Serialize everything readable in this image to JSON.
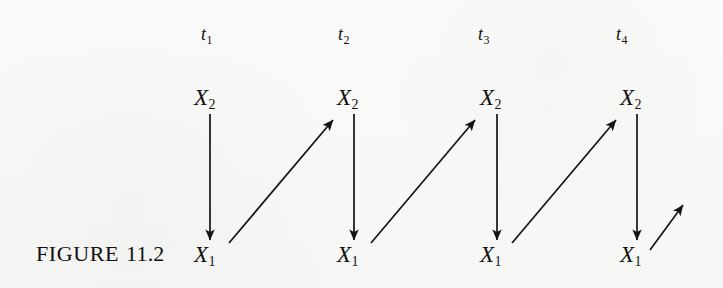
{
  "figure": {
    "caption_word": "FIGURE",
    "caption_number": "11.2",
    "background_color": "#fbfbfa",
    "ink_color": "#121212"
  },
  "time_axis": {
    "labels": [
      {
        "base": "t",
        "sub": "1",
        "x": 201,
        "y": 25
      },
      {
        "base": "t",
        "sub": "2",
        "x": 338,
        "y": 25
      },
      {
        "base": "t",
        "sub": "3",
        "x": 478,
        "y": 25
      },
      {
        "base": "t",
        "sub": "4",
        "x": 616,
        "y": 25
      }
    ]
  },
  "panels": [
    {
      "time": "t1",
      "top_label": {
        "base": "X",
        "sub": "2",
        "x": 194,
        "y": 86
      },
      "bottom_label": {
        "base": "X",
        "sub": "1",
        "x": 194,
        "y": 243
      },
      "vertical_arrow": {
        "x1": 210,
        "y1": 114,
        "x2": 210,
        "y2": 240,
        "direction": "down"
      }
    },
    {
      "time": "t2",
      "top_label": {
        "base": "X",
        "sub": "2",
        "x": 337,
        "y": 86
      },
      "bottom_label": {
        "base": "X",
        "sub": "1",
        "x": 337,
        "y": 243
      },
      "vertical_arrow": {
        "x1": 354,
        "y1": 114,
        "x2": 354,
        "y2": 240,
        "direction": "down"
      }
    },
    {
      "time": "t3",
      "top_label": {
        "base": "X",
        "sub": "2",
        "x": 480,
        "y": 86
      },
      "bottom_label": {
        "base": "X",
        "sub": "1",
        "x": 480,
        "y": 243
      },
      "vertical_arrow": {
        "x1": 497,
        "y1": 114,
        "x2": 497,
        "y2": 240,
        "direction": "down"
      }
    },
    {
      "time": "t4",
      "top_label": {
        "base": "X",
        "sub": "2",
        "x": 620,
        "y": 86
      },
      "bottom_label": {
        "base": "X",
        "sub": "1",
        "x": 620,
        "y": 243
      },
      "vertical_arrow": {
        "x1": 637,
        "y1": 114,
        "x2": 637,
        "y2": 240,
        "direction": "down"
      }
    }
  ],
  "cross_lagged_arrows": [
    {
      "from": "t1-X1",
      "to": "t2-X2",
      "x1": 229,
      "y1": 243,
      "x2": 333,
      "y2": 120
    },
    {
      "from": "t2-X1",
      "to": "t3-X2",
      "x1": 371,
      "y1": 243,
      "x2": 475,
      "y2": 120
    },
    {
      "from": "t3-X1",
      "to": "t4-X2",
      "x1": 512,
      "y1": 243,
      "x2": 616,
      "y2": 120
    },
    {
      "from": "t4-X1",
      "to": "t5-X2",
      "x1": 650,
      "y1": 250,
      "x2": 683,
      "y2": 205
    }
  ]
}
